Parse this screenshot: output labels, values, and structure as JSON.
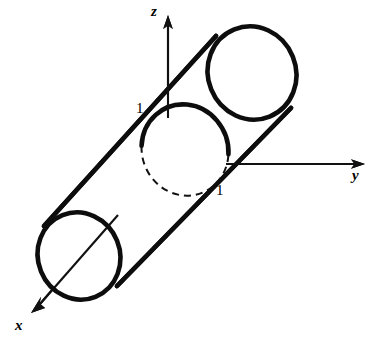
{
  "figure": {
    "kind": "3d-geometry-diagram",
    "background_color": "#ffffff",
    "ink_color": "#0d0d0d"
  },
  "axes": {
    "z": {
      "label": "z",
      "tip": {
        "x": 168,
        "y": 18
      },
      "origin": {
        "x": 168,
        "y": 170
      }
    },
    "y": {
      "label": "y",
      "tip": {
        "x": 364,
        "y": 164
      },
      "origin": {
        "x": 168,
        "y": 164
      }
    },
    "x": {
      "label": "x",
      "tip": {
        "x": 32,
        "y": 311
      },
      "origin": {
        "x": 168,
        "y": 170
      }
    }
  },
  "ticks": [
    {
      "label": "1",
      "axis": "z",
      "x": 136,
      "y": 101
    },
    {
      "label": "1",
      "axis": "y",
      "x": 216,
      "y": 183
    }
  ],
  "cylinder": {
    "radius_label": "1",
    "axis_direction": "diagonal from lower-left (x) to upper-right",
    "near_cap": {
      "cx": 79,
      "cy": 256,
      "rx": 41,
      "ry": 44,
      "rotation": -22,
      "visible": "full-ellipse"
    },
    "far_cap": {
      "cx": 252,
      "cy": 73,
      "rx": 44,
      "ry": 47,
      "rotation": -22,
      "visible": "front-arc-solid-back-arc-dashed"
    },
    "mid_cap": {
      "cx": 185,
      "cy": 150,
      "rx": 43,
      "ry": 46,
      "rotation": -22,
      "visible": "front-arc-solid-back-arc-dashed"
    }
  },
  "hidden_elements": [
    "dashed back arc of far end cap",
    "dashed back arc of middle unit circle",
    "dashed vertical drop from z-axis to corner point",
    "dashed horizontal segment from corner point to y-axis",
    "dashed diagonal segment along hidden x-axis"
  ]
}
